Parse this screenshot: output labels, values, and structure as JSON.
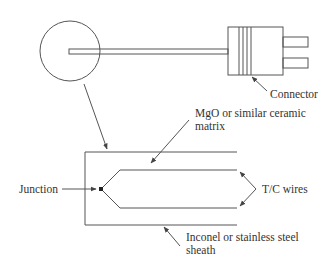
{
  "diagram": {
    "labels": {
      "connector": "Connector",
      "matrix_line1": "MgO or similar ceramic",
      "matrix_line2": "matrix",
      "junction": "Junction",
      "tc_wires": "T/C wires",
      "sheath_line1": "Inconel or stainless steel",
      "sheath_line2": "sheath"
    },
    "colors": {
      "line": "#555555",
      "text": "#333333",
      "background": "#ffffff"
    }
  }
}
